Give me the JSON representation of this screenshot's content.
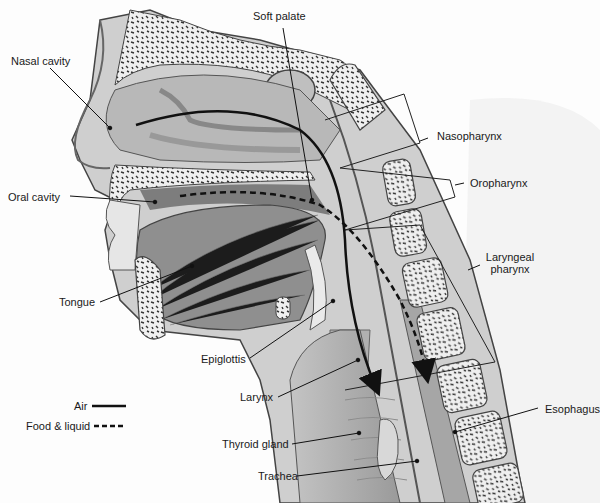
{
  "diagram": {
    "labels": {
      "nasal_cavity": "Nasal cavity",
      "soft_palate": "Soft palate",
      "nasopharynx": "Nasopharynx",
      "oral_cavity": "Oral cavity",
      "oropharynx": "Oropharynx",
      "laryngeal_pharynx_1": "Laryngeal",
      "laryngeal_pharynx_2": "pharynx",
      "tongue": "Tongue",
      "epiglottis": "Epiglottis",
      "larynx": "Larynx",
      "esophagus": "Esophagus",
      "thyroid_gland": "Thyroid gland",
      "trachea": "Trachea"
    },
    "legend": [
      {
        "label": "Air",
        "style": "solid"
      },
      {
        "label": "Food & liquid",
        "style": "dashed"
      }
    ],
    "colors": {
      "tissue_light": "#d6d6d6",
      "tissue_mid": "#a8a8a8",
      "muscle": "#8c8c8c",
      "bone": "#eeeeee",
      "outline": "#3a3a3a",
      "path_line": "#111111"
    }
  }
}
